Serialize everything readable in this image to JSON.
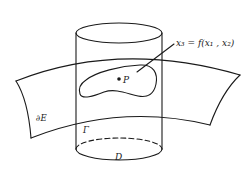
{
  "figure": {
    "type": "diagram",
    "labels": {
      "graph_equation": "x₃ = f(x₁ , x₂)",
      "point": "P",
      "surface_boundary": "∂E",
      "curve": "Γ",
      "domain": "D"
    },
    "colors": {
      "line": "#1a1a1a",
      "background": "#ffffff"
    }
  }
}
